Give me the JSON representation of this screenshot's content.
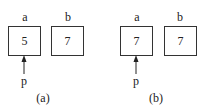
{
  "panels": [
    {
      "caption": "(a)",
      "cells": [
        {
          "name": "a",
          "value": "5"
        },
        {
          "name": "b",
          "value": "7"
        }
      ],
      "pointer": {
        "label": "p",
        "target": "a"
      }
    },
    {
      "caption": "(b)",
      "cells": [
        {
          "name": "a",
          "value": "7"
        },
        {
          "name": "b",
          "value": "7"
        }
      ],
      "pointer": {
        "label": "p",
        "target": "a"
      }
    }
  ]
}
